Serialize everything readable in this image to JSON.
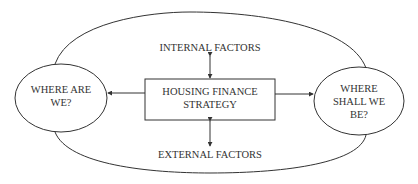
{
  "diagram": {
    "center_box": {
      "line1": "HOUSING FINANCE",
      "line2": "STRATEGY"
    },
    "left_node": {
      "line1": "WHERE ARE",
      "line2": "WE?"
    },
    "right_node": {
      "line1": "WHERE",
      "line2": "SHALL WE",
      "line3": "BE?"
    },
    "top_label": "INTERNAL FACTORS",
    "bottom_label": "EXTERNAL FACTORS",
    "colors": {
      "stroke": "#333333",
      "text": "#333333",
      "background": "#ffffff"
    }
  }
}
